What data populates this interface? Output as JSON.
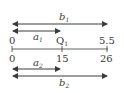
{
  "diagram": {
    "type": "number-line-comparison",
    "colors": {
      "line": "#3a3a3a",
      "text": "#3a3a3a",
      "background": "#ffffff"
    },
    "top_arrows": [
      {
        "id": "b1",
        "var": "b",
        "sub": "1",
        "from": 0,
        "to": "5.5"
      },
      {
        "id": "a1",
        "var": "a",
        "sub": "1",
        "from": 0,
        "to": "Q1"
      }
    ],
    "top_scale": {
      "left": "0",
      "mid_var": "Q",
      "mid_sub": "1",
      "right": "5.5"
    },
    "bottom_scale": {
      "left": "0",
      "mid": "15",
      "right": "26"
    },
    "bottom_arrows": [
      {
        "id": "a2",
        "var": "a",
        "sub": "2",
        "from": 0,
        "to": 15
      },
      {
        "id": "b2",
        "var": "b",
        "sub": "2",
        "from": 0,
        "to": 26
      }
    ]
  }
}
